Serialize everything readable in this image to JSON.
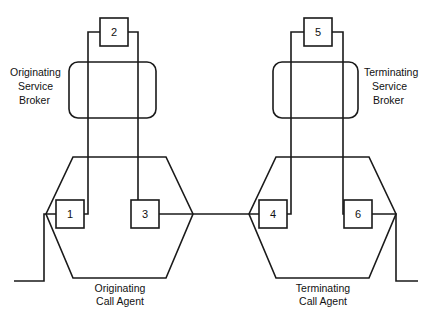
{
  "diagram": {
    "background_color": "#ffffff",
    "line_color": "#1a1a1a",
    "nodes": [
      {
        "id": "n1",
        "label": "1",
        "x": 56,
        "y": 200,
        "w": 28,
        "h": 28,
        "shape": "square"
      },
      {
        "id": "n2",
        "label": "2",
        "x": 100,
        "y": 18,
        "w": 28,
        "h": 28,
        "shape": "square"
      },
      {
        "id": "n3",
        "label": "3",
        "x": 131,
        "y": 200,
        "w": 28,
        "h": 28,
        "shape": "square"
      },
      {
        "id": "n4",
        "label": "4",
        "x": 259,
        "y": 200,
        "w": 28,
        "h": 28,
        "shape": "square"
      },
      {
        "id": "n5",
        "label": "5",
        "x": 304,
        "y": 18,
        "w": 28,
        "h": 28,
        "shape": "square"
      },
      {
        "id": "n6",
        "label": "6",
        "x": 344,
        "y": 200,
        "w": 28,
        "h": 28,
        "shape": "square"
      }
    ],
    "service_brokers": [
      {
        "id": "originating-service-broker",
        "label_lines": [
          "Originating",
          "Service",
          "Broker"
        ],
        "label_side": "left",
        "shape": "rounded-rect",
        "x": 69,
        "y": 62,
        "w": 87,
        "h": 56,
        "r": 9,
        "label_x": 63,
        "label_y": 76
      },
      {
        "id": "terminating-service-broker",
        "label_lines": [
          "Terminating",
          "Service",
          "Broker"
        ],
        "label_side": "right",
        "shape": "rounded-rect",
        "x": 273,
        "y": 62,
        "w": 85,
        "h": 56,
        "r": 9,
        "label_x": 364,
        "label_y": 76
      }
    ],
    "call_agents": [
      {
        "id": "originating-call-agent",
        "label_lines": [
          "Originating",
          "Call Agent"
        ],
        "shape": "hexagon",
        "points": "73,157 166,157 193,214 166,278 73,278 46,214",
        "label_x": 120,
        "label_y": 292
      },
      {
        "id": "terminating-call-agent",
        "label_lines": [
          "Terminating",
          "Call Agent"
        ],
        "shape": "hexagon",
        "points": "276,157 369,157 396,214 369,278 276,278 249,214",
        "label_x": 323,
        "label_y": 292
      }
    ],
    "wires": [
      {
        "id": "wire-n2-left-to-n1",
        "from": "2",
        "to": "1",
        "path": "M 100 32 L 88 32 L 88 214 L 72 214"
      },
      {
        "id": "wire-n2-right-to-n3",
        "from": "2",
        "to": "3",
        "path": "M 128 32 L 138 32 L 138 214 L 145 214"
      },
      {
        "id": "wire-n5-left-to-n4",
        "from": "5",
        "to": "4",
        "path": "M 304 32 L 291 32 L 291 214 L 275 214"
      },
      {
        "id": "wire-n5-right-to-n6",
        "from": "5",
        "to": "6",
        "path": "M 332 32 L 343 32 L 343 214 L 358 214"
      },
      {
        "id": "wire-n3-to-n4",
        "from": "3",
        "to": "4",
        "path": "M 159 214 L 259 214"
      },
      {
        "id": "wire-n1-to-external",
        "from": "1",
        "to": "external-left",
        "path": "M 56 214 L 44 214 L 44 281 L 14 281"
      },
      {
        "id": "wire-n6-to-external",
        "from": "6",
        "to": "external-right",
        "path": "M 372 214 L 396 214 L 396 281 L 418 281"
      }
    ]
  }
}
